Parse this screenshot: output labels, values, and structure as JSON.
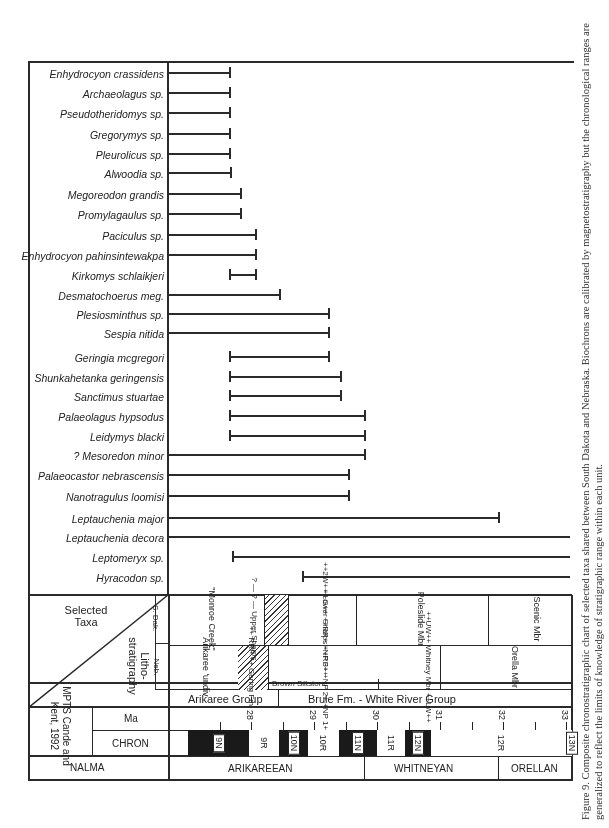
{
  "figure": {
    "caption": "Figure 9. Composite chronostratigraphic chart of selected taxa shared between South Dakota and Nebraska. Biochrons are calibrated by magnetostratigraphy but the chronological ranges are generalized to reflect the limits of knowledge of stratigraphic range within each unit."
  },
  "header": {
    "selected_taxa": "Selected Taxa",
    "lithostratigraphy": "Litho-stratigraphy",
    "neb": "Neb.",
    "s_dak": "S. Dak.",
    "mpts": "MPTS Cande and Kent, 1992",
    "ma": "Ma",
    "chron": "CHRON",
    "nalma": "NALMA"
  },
  "lithostratigraphy": {
    "groups": [
      {
        "label": "Arikaree Group"
      },
      {
        "label": "Brule Fm. - White River Group"
      }
    ],
    "nebraska": [
      {
        "label": "Arikaree 'undiv"
      },
      {
        "label": "++ RRP ++ Gering Fm."
      },
      {
        "label": "++G++ ++RR+ +NP 3+ +NP 2+ +NP 1+"
      },
      {
        "label": "Brown Siltstone"
      },
      {
        "label": "++UW++ Whitney Mbr ++LW++"
      },
      {
        "label": "Orella Mbr"
      }
    ],
    "south_dakota": [
      {
        "label": "\"Monroe Creek\""
      },
      {
        "label": "? — ? — Upper Sharps"
      },
      {
        "label": "++2W++ Lower Sharps ++RF++"
      },
      {
        "label": "Poleslide Mbr"
      },
      {
        "label": "Scenic Mbr"
      }
    ]
  },
  "nalma": [
    {
      "label": "ARIKAREEAN"
    },
    {
      "label": "WHITNEYAN"
    },
    {
      "label": "ORELLAN"
    }
  ],
  "chart_data": {
    "type": "range",
    "title": "Composite chronostratigraphic chart of selected taxa shared between South Dakota and Nebraska",
    "xlabel": "Ma",
    "axis_ticks_ma": [
      "28",
      "29",
      "30",
      "31",
      "32",
      "33"
    ],
    "axis_range_ma": [
      27.0,
      33.4
    ],
    "chrons": [
      {
        "name": "9N",
        "polarity": "N",
        "from": 27.0,
        "to": 27.97
      },
      {
        "name": "9R",
        "polarity": "R",
        "from": 27.97,
        "to": 28.45
      },
      {
        "name": "10N",
        "polarity": "N",
        "from": 28.45,
        "to": 28.9
      },
      {
        "name": "10R",
        "polarity": "R",
        "from": 28.9,
        "to": 29.4
      },
      {
        "name": "11N",
        "polarity": "N",
        "from": 29.4,
        "to": 30.0
      },
      {
        "name": "11R",
        "polarity": "R",
        "from": 30.0,
        "to": 30.45
      },
      {
        "name": "12N",
        "polarity": "N",
        "from": 30.45,
        "to": 30.85
      },
      {
        "name": "12R",
        "polarity": "R",
        "from": 30.85,
        "to": 33.1
      },
      {
        "name": "13N",
        "polarity": "N",
        "from": 33.1,
        "to": 33.4
      }
    ],
    "taxa": [
      {
        "name": "Enhydrocyon crassidens",
        "from_px": 168,
        "to_px": 230,
        "cap_start": false
      },
      {
        "name": "Archaeolagus sp.",
        "from_px": 168,
        "to_px": 230,
        "cap_start": false
      },
      {
        "name": "Pseudotheridomys sp.",
        "from_px": 168,
        "to_px": 230,
        "cap_start": false
      },
      {
        "name": "Gregorymys sp.",
        "from_px": 168,
        "to_px": 230,
        "cap_start": false
      },
      {
        "name": "Pleurolicus sp.",
        "from_px": 168,
        "to_px": 230,
        "cap_start": false
      },
      {
        "name": "Alwoodia sp.",
        "from_px": 168,
        "to_px": 231,
        "cap_start": false
      },
      {
        "name": "Megoreodon grandis",
        "from_px": 168,
        "to_px": 241,
        "cap_start": false
      },
      {
        "name": "Promylagaulus sp.",
        "from_px": 168,
        "to_px": 241,
        "cap_start": false
      },
      {
        "name": "Paciculus sp.",
        "from_px": 168,
        "to_px": 256,
        "cap_start": false
      },
      {
        "name": "Enhydrocyon pahinsintewakpa",
        "from_px": 168,
        "to_px": 256,
        "cap_start": false
      },
      {
        "name": "Kirkomys schlaikjeri",
        "from_px": 230,
        "to_px": 256,
        "cap_start": true
      },
      {
        "name": "Desmatochoerus meg.",
        "from_px": 168,
        "to_px": 280,
        "cap_start": false
      },
      {
        "name": "Plesiosminthus sp.",
        "from_px": 168,
        "to_px": 329,
        "cap_start": false
      },
      {
        "name": "Sespia nitida",
        "from_px": 168,
        "to_px": 329,
        "cap_start": false
      },
      {
        "name": "Geringia mcgregori",
        "from_px": 230,
        "to_px": 329,
        "cap_start": true
      },
      {
        "name": "Shunkahetanka geringensis",
        "from_px": 230,
        "to_px": 341,
        "cap_start": true
      },
      {
        "name": "Sanctimus stuartae",
        "from_px": 230,
        "to_px": 341,
        "cap_start": true
      },
      {
        "name": "Palaeolagus hypsodus",
        "from_px": 230,
        "to_px": 365,
        "cap_start": true
      },
      {
        "name": "Leidymys blacki",
        "from_px": 230,
        "to_px": 365,
        "cap_start": true
      },
      {
        "name": "? Mesoredon minor",
        "from_px": 168,
        "to_px": 365,
        "cap_start": false
      },
      {
        "name": "Palaeocastor nebrascensis",
        "from_px": 168,
        "to_px": 349,
        "cap_start": false
      },
      {
        "name": "Nanotragulus loomisi",
        "from_px": 168,
        "to_px": 349,
        "cap_start": false
      },
      {
        "name": "Leptauchenia major",
        "from_px": 168,
        "to_px": 499,
        "cap_start": false
      },
      {
        "name": "Leptauchenia decora",
        "from_px": 168,
        "to_px": 570,
        "cap_start": false,
        "cap_end": false
      },
      {
        "name": "Leptomeryx sp.",
        "from_px": 233,
        "to_px": 570,
        "cap_start": true,
        "cap_end": false
      },
      {
        "name": "Hyracodon sp.",
        "from_px": 303,
        "to_px": 570,
        "cap_start": true,
        "cap_end": false
      }
    ]
  }
}
